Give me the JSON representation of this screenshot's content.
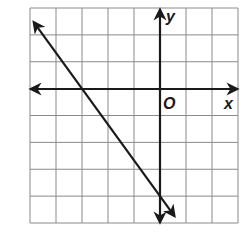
{
  "chart_data": {
    "type": "line",
    "title": "",
    "xlabel": "x",
    "ylabel": "y",
    "origin_label": "O",
    "xlim": [
      -5,
      3
    ],
    "ylim": [
      -5,
      3
    ],
    "grid": true,
    "grid_step": 1,
    "tick_labels": [],
    "series": [
      {
        "name": "line",
        "equation": "y = -4/3 x - 4",
        "slope": -1.3333,
        "x_intercept": -3,
        "y_intercept": -4,
        "points": [
          [
            -3,
            0
          ],
          [
            0,
            -4
          ]
        ],
        "arrows_both_ends": true
      }
    ],
    "legend": null
  },
  "labels": {
    "x_axis": "x",
    "y_axis": "y",
    "origin": "O"
  },
  "colors": {
    "grid": "#8a8a8a",
    "axes": "#1a1a1a",
    "line": "#1a1a1a",
    "background": "#ffffff"
  }
}
